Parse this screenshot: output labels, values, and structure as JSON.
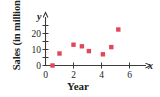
{
  "chart_data": {
    "type": "scatter",
    "title": "",
    "xlabel": "Year",
    "ylabel": "Sales (in millions)",
    "x_axis_symbol": "x",
    "y_axis_symbol": "y",
    "xticks": [
      0,
      2,
      4,
      6
    ],
    "xtick_labels": [
      "0",
      "2",
      "4",
      "6"
    ],
    "yticks": [
      0,
      10,
      20
    ],
    "ytick_labels": [
      "0",
      "10",
      "20"
    ],
    "xlim": [
      0,
      6.6
    ],
    "ylim": [
      0,
      26
    ],
    "grid": false,
    "legend": null,
    "marker_shape": "square",
    "marker_color": "#e2465c",
    "points": [
      {
        "x": 0.5,
        "y": 0
      },
      {
        "x": 1.0,
        "y": 7.5
      },
      {
        "x": 2.0,
        "y": 13
      },
      {
        "x": 2.6,
        "y": 12
      },
      {
        "x": 3.1,
        "y": 9
      },
      {
        "x": 4.1,
        "y": 7
      },
      {
        "x": 4.7,
        "y": 11.5
      },
      {
        "x": 5.2,
        "y": 22.5
      }
    ]
  },
  "colors": {
    "marker": "#e2465c",
    "axis": "#3b3b3b",
    "text": "#201c1c",
    "background": "#ffffff"
  }
}
